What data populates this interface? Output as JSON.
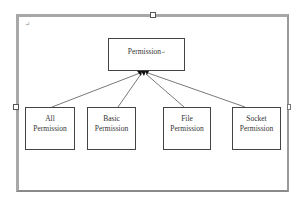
{
  "diagram": {
    "type": "hierarchy",
    "paragraph_mark": "↵",
    "root": {
      "label": "Permission",
      "suffix": "↵"
    },
    "children": [
      {
        "line1": "All",
        "line2": "Permission"
      },
      {
        "line1": "Basic",
        "line2": "Permission"
      },
      {
        "line1": "File",
        "line2": "Permission"
      },
      {
        "line1": "Socket",
        "line2": "Permission"
      }
    ],
    "edges": [
      {
        "from": "All Permission",
        "to": "Permission"
      },
      {
        "from": "Basic Permission",
        "to": "Permission"
      },
      {
        "from": "File Permission",
        "to": "Permission"
      },
      {
        "from": "Socket Permission",
        "to": "Permission"
      }
    ],
    "colors": {
      "frame": "#a8a8a8",
      "box_border": "#444444",
      "line": "#555555",
      "arrowhead": "#111111"
    }
  }
}
